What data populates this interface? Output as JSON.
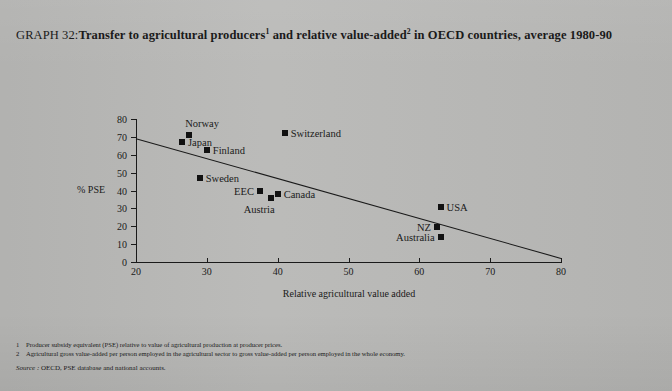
{
  "title": {
    "prefix": "GRAPH 32:",
    "main_a": "Transfer to agricultural producers",
    "sup_a": "1",
    "main_b": " and relative value-added",
    "sup_b": "2",
    "main_c": " in OECD countries, average 1980-90"
  },
  "chart_data": {
    "type": "scatter",
    "xlabel": "Relative agricultural value added",
    "ylabel": "% PSE",
    "xlim": [
      20,
      80
    ],
    "ylim": [
      0,
      80
    ],
    "xticks": [
      20,
      30,
      40,
      50,
      60,
      70,
      80
    ],
    "yticks": [
      0,
      10,
      20,
      30,
      40,
      50,
      60,
      70,
      80
    ],
    "grid": false,
    "legend": "none",
    "points": [
      {
        "label": "Norway",
        "x": 27.5,
        "y": 71.0,
        "label_pos": "above"
      },
      {
        "label": "Japan",
        "x": 26.5,
        "y": 67.0,
        "label_pos": "right"
      },
      {
        "label": "Finland",
        "x": 30.0,
        "y": 62.5,
        "label_pos": "right"
      },
      {
        "label": "Sweden",
        "x": 29.0,
        "y": 47.0,
        "label_pos": "right"
      },
      {
        "label": "Switzerland",
        "x": 41.0,
        "y": 72.0,
        "label_pos": "right"
      },
      {
        "label": "EEC",
        "x": 37.5,
        "y": 40.0,
        "label_pos": "left"
      },
      {
        "label": "Austria",
        "x": 39.0,
        "y": 36.0,
        "label_pos": "below"
      },
      {
        "label": "Canada",
        "x": 40.0,
        "y": 38.0,
        "label_pos": "right"
      },
      {
        "label": "USA",
        "x": 63.0,
        "y": 31.0,
        "label_pos": "right"
      },
      {
        "label": "NZ",
        "x": 62.5,
        "y": 19.5,
        "label_pos": "left"
      },
      {
        "label": "Australia",
        "x": 63.0,
        "y": 14.0,
        "label_pos": "left"
      }
    ],
    "trendline": {
      "x0": 20,
      "y0": 69,
      "x1": 80,
      "y1": 2
    }
  },
  "footnotes": [
    {
      "num": "1",
      "text": "Producer subsidy equivalent (PSE) relative to value of agricultural production at producer prices."
    },
    {
      "num": "2",
      "text": "Agricultural gross value-added per person employed in the agricultural sector to gross value-added per person employed in the whole economy."
    }
  ],
  "source": {
    "label": "Source :",
    "text": " OECD, PSE database and national accounts."
  }
}
